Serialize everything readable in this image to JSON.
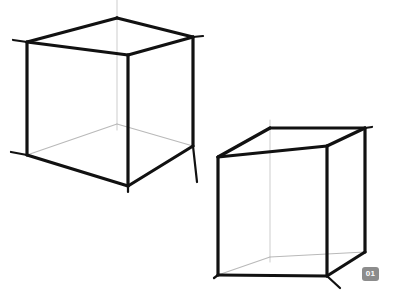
{
  "canvas": {
    "width": 393,
    "height": 296,
    "background_color": "#ffffff",
    "title": "Two wireframe cubes in perspective"
  },
  "style": {
    "visible_edge_color": "#111111",
    "hidden_edge_color": "#b9b9b9",
    "construction_line_color": "#d2d2d2",
    "visible_edge_width": 3.2,
    "hidden_edge_width": 1.1,
    "construction_line_width": 1.1
  },
  "badge": {
    "label": "01",
    "background_color": "#8c8c8c",
    "text_color": "#ffffff",
    "x": 362,
    "y": 267
  },
  "shapes": [
    {
      "name": "cube-large",
      "vertices": {
        "front_top": [
          128,
          55
        ],
        "left_top": [
          27,
          42
        ],
        "right_top": [
          193,
          37
        ],
        "back_top": [
          117,
          18
        ],
        "front_bottom": [
          128,
          186
        ],
        "left_bottom": [
          27,
          155
        ],
        "right_bottom": [
          193,
          146
        ],
        "back_bottom": [
          117,
          124
        ]
      },
      "visible_edges": [
        [
          "left_top",
          "back_top"
        ],
        [
          "back_top",
          "right_top"
        ],
        [
          "left_top",
          "front_top"
        ],
        [
          "front_top",
          "right_top"
        ],
        [
          "left_top",
          "left_bottom"
        ],
        [
          "front_top",
          "front_bottom"
        ],
        [
          "right_top",
          "right_bottom"
        ],
        [
          "left_bottom",
          "front_bottom"
        ],
        [
          "front_bottom",
          "right_bottom"
        ]
      ],
      "hidden_edges": [
        [
          "left_bottom",
          "back_bottom"
        ],
        [
          "back_bottom",
          "right_bottom"
        ]
      ],
      "construction_lines": [
        [
          [
            117,
            0
          ],
          [
            117,
            130
          ]
        ]
      ],
      "overshoots": [
        [
          [
            27,
            42
          ],
          [
            13,
            40
          ]
        ],
        [
          [
            27,
            155
          ],
          [
            11,
            152
          ]
        ],
        [
          [
            193,
            37
          ],
          [
            203,
            36
          ]
        ],
        [
          [
            193,
            146
          ],
          [
            197,
            182
          ]
        ],
        [
          [
            128,
            186
          ],
          [
            128,
            192
          ]
        ]
      ]
    },
    {
      "name": "cube-small",
      "vertices": {
        "front_top": [
          327,
          146
        ],
        "left_top": [
          218,
          157
        ],
        "right_top": [
          365,
          128
        ],
        "back_top": [
          270,
          128
        ],
        "front_bottom": [
          327,
          276
        ],
        "left_bottom": [
          218,
          275
        ],
        "right_bottom": [
          365,
          252
        ],
        "back_bottom": [
          270,
          257
        ]
      },
      "visible_edges": [
        [
          "left_top",
          "back_top"
        ],
        [
          "back_top",
          "right_top"
        ],
        [
          "left_top",
          "front_top"
        ],
        [
          "front_top",
          "right_top"
        ],
        [
          "left_top",
          "left_bottom"
        ],
        [
          "front_top",
          "front_bottom"
        ],
        [
          "right_top",
          "right_bottom"
        ],
        [
          "left_bottom",
          "front_bottom"
        ],
        [
          "front_bottom",
          "right_bottom"
        ]
      ],
      "hidden_edges": [
        [
          "left_bottom",
          "back_bottom"
        ],
        [
          "back_bottom",
          "right_bottom"
        ]
      ],
      "construction_lines": [
        [
          [
            270,
            120
          ],
          [
            270,
            262
          ]
        ]
      ],
      "overshoots": [
        [
          [
            327,
            276
          ],
          [
            340,
            288
          ]
        ],
        [
          [
            365,
            128
          ],
          [
            372,
            127
          ]
        ],
        [
          [
            218,
            275
          ],
          [
            214,
            278
          ]
        ]
      ]
    }
  ]
}
